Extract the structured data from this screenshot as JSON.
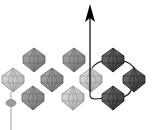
{
  "diagram": {
    "type": "octahedra-chain",
    "colors": {
      "light": "#c4c4c4",
      "medium": "#8c8c8c",
      "dark": "#4a4a4a",
      "arrow": "#000000",
      "path": "#111111",
      "pin": "#9a9a9a"
    },
    "octahedra": [
      {
        "id": "o1",
        "cx": 13,
        "cy": 80,
        "shade": "light"
      },
      {
        "id": "o2",
        "cx": 34,
        "cy": 60,
        "shade": "medium"
      },
      {
        "id": "o3",
        "cx": 52,
        "cy": 80,
        "shade": "medium"
      },
      {
        "id": "o4",
        "cx": 33,
        "cy": 98,
        "shade": "medium"
      },
      {
        "id": "o5",
        "cx": 74,
        "cy": 60,
        "shade": "medium"
      },
      {
        "id": "o6",
        "cx": 73,
        "cy": 98,
        "shade": "light"
      },
      {
        "id": "o7",
        "cx": 91,
        "cy": 80,
        "shade": "light"
      },
      {
        "id": "o8",
        "cx": 113,
        "cy": 60,
        "shade": "dark"
      },
      {
        "id": "o9",
        "cx": 134,
        "cy": 80,
        "shade": "dark"
      },
      {
        "id": "o10",
        "cx": 113,
        "cy": 98,
        "shade": "dark"
      }
    ],
    "arrow": {
      "x": 90,
      "y_start": 92,
      "y_end": 6
    },
    "pin": {
      "x": 11,
      "ellipse_y": 103
    }
  }
}
